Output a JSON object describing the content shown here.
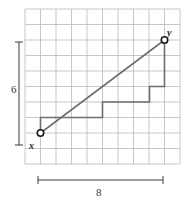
{
  "figure": {
    "type": "coordinate-grid-slope-diagram",
    "background": "#ffffff"
  },
  "grid": {
    "columns": 10,
    "rows": 10,
    "cell_size": 15.5,
    "origin_x": 25,
    "origin_y": 9,
    "line_color": "#b9b9b9",
    "line_width": 0.8
  },
  "points": [
    {
      "name": "x",
      "label": "x",
      "gx": 1,
      "gy": 2,
      "px": 40.5,
      "py": 133,
      "marker": "open-circle",
      "label_dx": -11,
      "label_dy": 7
    },
    {
      "name": "y",
      "label": "y",
      "gx": 9,
      "gy": 8,
      "px": 164.5,
      "py": 40,
      "marker": "open-circle",
      "label_dx": 3,
      "label_dy": -13
    }
  ],
  "segment": {
    "name": "xy-segment",
    "from": {
      "px": 40.5,
      "py": 133
    },
    "to": {
      "px": 164.5,
      "py": 40
    },
    "color": "#6e6e6e",
    "width": 1.6
  },
  "staircase": {
    "name": "slope-staircase",
    "color": "#6e6e6e",
    "width": 1.6,
    "points_px": [
      [
        40.5,
        133
      ],
      [
        40.5,
        117.5
      ],
      [
        102.5,
        117.5
      ],
      [
        102.5,
        102
      ],
      [
        149.5,
        102
      ],
      [
        149.5,
        86.5
      ],
      [
        164.5,
        86.5
      ],
      [
        164.5,
        40
      ]
    ]
  },
  "brackets": {
    "vertical": {
      "name": "rise-bracket",
      "label": "6",
      "x_px": 19,
      "y_top_px": 42,
      "y_bottom_px": 145,
      "cap_half_width": 4,
      "color": "#3a3a3a"
    },
    "horizontal": {
      "name": "run-bracket",
      "label": "8",
      "y_px": 180,
      "x_left_px": 38,
      "x_right_px": 163,
      "cap_half_height": 4,
      "color": "#3a3a3a"
    }
  },
  "measurements": {
    "rise_label": "6",
    "run_label": "8"
  },
  "labels": {
    "point_x": "x",
    "point_y": "y"
  }
}
